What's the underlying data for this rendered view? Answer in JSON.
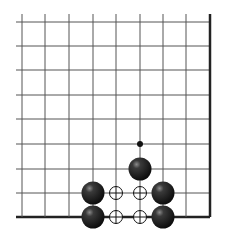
{
  "diagram": {
    "type": "go-board-fragment",
    "columns": 9,
    "rows": 9,
    "grid_x": [
      22,
      45,
      69,
      93,
      116,
      140,
      163,
      186,
      210
    ],
    "grid_y": [
      22,
      46,
      70,
      95,
      119,
      144,
      169,
      193,
      217
    ],
    "edges": {
      "right": true,
      "bottom": true,
      "left": false,
      "top": false
    },
    "colors": {
      "line": "#555555",
      "edge": "#222222",
      "black_stone": "#1a1a1a",
      "background": "#ffffff"
    },
    "black_stones": [
      {
        "col": 5,
        "row": 6
      },
      {
        "col": 3,
        "row": 7
      },
      {
        "col": 3,
        "row": 8
      },
      {
        "col": 6,
        "row": 7
      },
      {
        "col": 6,
        "row": 8
      }
    ],
    "empty_circle_marks": [
      {
        "col": 4,
        "row": 7
      },
      {
        "col": 5,
        "row": 7
      },
      {
        "col": 4,
        "row": 8
      },
      {
        "col": 5,
        "row": 8
      }
    ],
    "small_dot_marks": [
      {
        "col": 5,
        "row": 5
      }
    ]
  }
}
